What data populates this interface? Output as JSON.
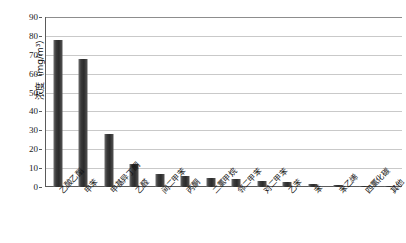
{
  "page": {
    "caption_left": "",
    "caption_right": ""
  },
  "chart_data": {
    "type": "bar",
    "title": "",
    "xlabel": "",
    "ylabel": "浓度（mg/m³）",
    "ylim": [
      0,
      90
    ],
    "yticks": [
      0,
      10,
      20,
      30,
      40,
      50,
      60,
      70,
      80,
      90
    ],
    "grid": true,
    "legend": "none",
    "bar_color": "#333333",
    "categories": [
      "乙酸乙酯",
      "甲苯",
      "甲基异丁酮",
      "乙醛",
      "间二甲苯",
      "丙酮",
      "二氯甲烷",
      "邻二甲苯",
      "对二甲苯",
      "乙苯",
      "苯",
      "苯乙烯",
      "四氯化碳",
      "其他"
    ],
    "values": [
      78,
      68,
      28,
      12,
      7,
      6,
      5,
      4,
      3,
      2.4,
      1.6,
      1.1,
      0.8,
      0.6
    ],
    "units": "mg/m³"
  }
}
